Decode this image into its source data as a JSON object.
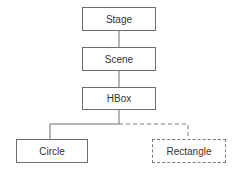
{
  "diagram": {
    "nodes": [
      {
        "id": "stage",
        "label": "Stage",
        "style": "solid"
      },
      {
        "id": "scene",
        "label": "Scene",
        "style": "solid"
      },
      {
        "id": "hbox",
        "label": "HBox",
        "style": "solid"
      },
      {
        "id": "circle",
        "label": "Circle",
        "style": "solid"
      },
      {
        "id": "rectangle",
        "label": "Rectangle",
        "style": "dashed"
      }
    ],
    "edges": [
      {
        "from": "stage",
        "to": "scene",
        "style": "solid"
      },
      {
        "from": "scene",
        "to": "hbox",
        "style": "solid"
      },
      {
        "from": "hbox",
        "to": "circle",
        "style": "solid"
      },
      {
        "from": "hbox",
        "to": "rectangle",
        "style": "dashed"
      }
    ],
    "colors": {
      "line": "#6e6e6e",
      "text": "#333333",
      "background": "#ffffff"
    }
  }
}
